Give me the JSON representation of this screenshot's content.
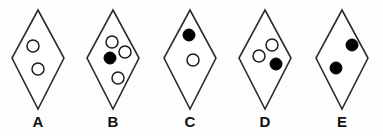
{
  "figure": {
    "background_color": "#fdfdfd",
    "outline_color": "#2b2b2b",
    "dot_open_color": "#ffffff",
    "dot_filled_color": "#000000",
    "label_color": "#111111",
    "dot_radius": 6,
    "options": [
      {
        "id": "A",
        "label": "A",
        "label_x": 38,
        "label_y": 127,
        "center_x": 38,
        "top_y": 10,
        "bottom_y": 109,
        "half_width": 26,
        "mid_y": 58,
        "dot_count": 4,
        "filled_count": 0,
        "open_count": 2,
        "dots": [
          {
            "cx": 33,
            "cy": 46,
            "fill": "open"
          },
          {
            "cx": 38,
            "cy": 69,
            "fill": "open"
          }
        ]
      },
      {
        "id": "B",
        "label": "B",
        "label_x": 113,
        "label_y": 127,
        "center_x": 113,
        "top_y": 10,
        "bottom_y": 109,
        "half_width": 26,
        "mid_y": 58,
        "dot_count": 4,
        "filled_count": 1,
        "open_count": 3,
        "dots": [
          {
            "cx": 112,
            "cy": 42,
            "fill": "open"
          },
          {
            "cx": 125,
            "cy": 52,
            "fill": "open"
          },
          {
            "cx": 110,
            "cy": 58,
            "fill": "filled"
          },
          {
            "cx": 118,
            "cy": 78,
            "fill": "open"
          }
        ]
      },
      {
        "id": "C",
        "label": "C",
        "label_x": 190,
        "label_y": 127,
        "center_x": 190,
        "top_y": 10,
        "bottom_y": 109,
        "half_width": 26,
        "mid_y": 58,
        "dot_count": 2,
        "filled_count": 1,
        "open_count": 1,
        "dots": [
          {
            "cx": 189,
            "cy": 35,
            "fill": "filled"
          },
          {
            "cx": 193,
            "cy": 60,
            "fill": "open"
          }
        ]
      },
      {
        "id": "D",
        "label": "D",
        "label_x": 265,
        "label_y": 127,
        "center_x": 265,
        "top_y": 10,
        "bottom_y": 109,
        "half_width": 26,
        "mid_y": 58,
        "dot_count": 3,
        "filled_count": 1,
        "open_count": 2,
        "dots": [
          {
            "cx": 272,
            "cy": 45,
            "fill": "open"
          },
          {
            "cx": 259,
            "cy": 56,
            "fill": "open"
          },
          {
            "cx": 276,
            "cy": 64,
            "fill": "filled"
          }
        ]
      },
      {
        "id": "E",
        "label": "E",
        "label_x": 342,
        "label_y": 127,
        "center_x": 342,
        "top_y": 10,
        "bottom_y": 109,
        "half_width": 26,
        "mid_y": 58,
        "dot_count": 2,
        "filled_count": 2,
        "open_count": 0,
        "dots": [
          {
            "cx": 352,
            "cy": 45,
            "fill": "filled"
          },
          {
            "cx": 336,
            "cy": 68,
            "fill": "filled"
          }
        ]
      }
    ]
  }
}
